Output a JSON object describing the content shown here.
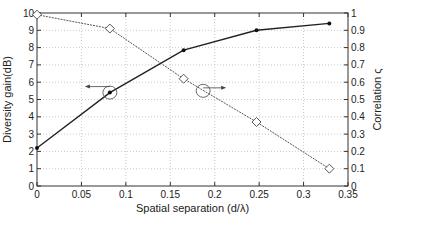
{
  "chart_data": {
    "type": "line",
    "title": "",
    "xlabel": "Spatial separation (d/λ)",
    "ylabel_left": "Diversity gain(dB)",
    "ylabel_right": "Correlation ς",
    "xlim": [
      0,
      0.35
    ],
    "ylim_left": [
      0,
      10
    ],
    "ylim_right": [
      0,
      1
    ],
    "x_ticks": [
      "0",
      "0.05",
      "0.1",
      "0.15",
      "0.2",
      "0.25",
      "0.3",
      "0.35"
    ],
    "y_left_ticks": [
      "0",
      "1",
      "2",
      "3",
      "4",
      "5",
      "6",
      "7",
      "8",
      "9",
      "10"
    ],
    "y_right_ticks": [
      "0",
      "0.1",
      "0.2",
      "0.3",
      "0.4",
      "0.5",
      "0.6",
      "0.7",
      "0.8",
      "0.9",
      "1"
    ],
    "grid": true,
    "legend": null,
    "series": [
      {
        "name": "Diversity gain (dB)",
        "axis": "left",
        "style": "solid",
        "marker": "dot",
        "color": "#222222",
        "x": [
          0,
          0.082,
          0.165,
          0.247,
          0.329
        ],
        "values": [
          2.2,
          5.4,
          7.85,
          9.0,
          9.4
        ]
      },
      {
        "name": "Correlation",
        "axis": "right",
        "style": "dashed",
        "marker": "diamond",
        "color": "#444444",
        "x": [
          0,
          0.082,
          0.165,
          0.247,
          0.329
        ],
        "values": [
          0.99,
          0.91,
          0.62,
          0.37,
          0.1
        ]
      }
    ],
    "annotations": [
      {
        "type": "circle-arrow",
        "points_to": "left-axis",
        "at": [
          0.082,
          5.4
        ]
      },
      {
        "type": "circle-arrow",
        "points_to": "right-axis",
        "at": [
          0.187,
          0.55
        ]
      }
    ]
  }
}
